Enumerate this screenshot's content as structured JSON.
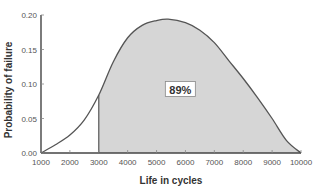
{
  "chart_data": {
    "type": "area",
    "title": "",
    "xlabel": "Life in cycles",
    "ylabel": "Probability of failure",
    "xlim": [
      1000,
      10000
    ],
    "ylim": [
      0,
      0.2
    ],
    "xticks": [
      1000,
      2000,
      3000,
      4000,
      5000,
      6000,
      7000,
      8000,
      9000,
      10000
    ],
    "xtick_labels": [
      "1000",
      "2000",
      "3000",
      "4000",
      "5000",
      "6000",
      "7000",
      "8000",
      "9000",
      "10000"
    ],
    "yticks": [
      0,
      0.05,
      0.1,
      0.15,
      0.2
    ],
    "ytick_labels": [
      "0.00",
      "0.05",
      "0.10",
      "0.15",
      "0.20"
    ],
    "grid": false,
    "legend": null,
    "series": [
      {
        "name": "Probability density",
        "x": [
          1000,
          1500,
          2000,
          2500,
          3000,
          3500,
          4000,
          4500,
          5000,
          5400,
          6000,
          6500,
          7000,
          7500,
          8000,
          8500,
          9000,
          9500,
          10000
        ],
        "y": [
          0.0,
          0.012,
          0.026,
          0.048,
          0.084,
          0.132,
          0.167,
          0.185,
          0.192,
          0.194,
          0.189,
          0.178,
          0.16,
          0.134,
          0.108,
          0.08,
          0.05,
          0.018,
          0.0
        ]
      }
    ],
    "shaded_region": {
      "from_x": 3000,
      "to_x": 10000,
      "fill": "#d6d6d6"
    },
    "annotations": [
      {
        "text": "89%",
        "x": 5200,
        "y": 0.092,
        "boxed": true
      }
    ],
    "colors": {
      "line": "#555555",
      "fill": "#d6d6d6",
      "axis": "#444444"
    }
  }
}
